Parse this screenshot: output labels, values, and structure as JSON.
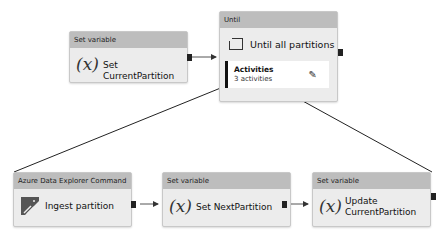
{
  "nodes": {
    "set_current": {
      "type": "Set variable",
      "name": "Set CurrentPartition",
      "icon": "variable-icon",
      "glyph": "(x)"
    },
    "until": {
      "type": "Until",
      "name": "Until all partitions",
      "icon": "until-loop-icon",
      "activities_label": "Activities",
      "activities_count": "3 activities",
      "edit_icon": "pencil-icon",
      "glyph": "✎"
    },
    "ingest": {
      "type": "Azure Data Explorer Command",
      "name": "Ingest partition",
      "icon": "azure-data-explorer-icon"
    },
    "set_next": {
      "type": "Set variable",
      "name": "Set NextPartition",
      "icon": "variable-icon",
      "glyph": "(x)"
    },
    "update_current": {
      "type": "Set variable",
      "name_line1": "Update",
      "name_line2": "CurrentPartition",
      "icon": "variable-icon",
      "glyph": "(x)"
    }
  },
  "colors": {
    "header": "#bdbdbd",
    "node_bg": "#ececec",
    "connector": "#333333"
  }
}
